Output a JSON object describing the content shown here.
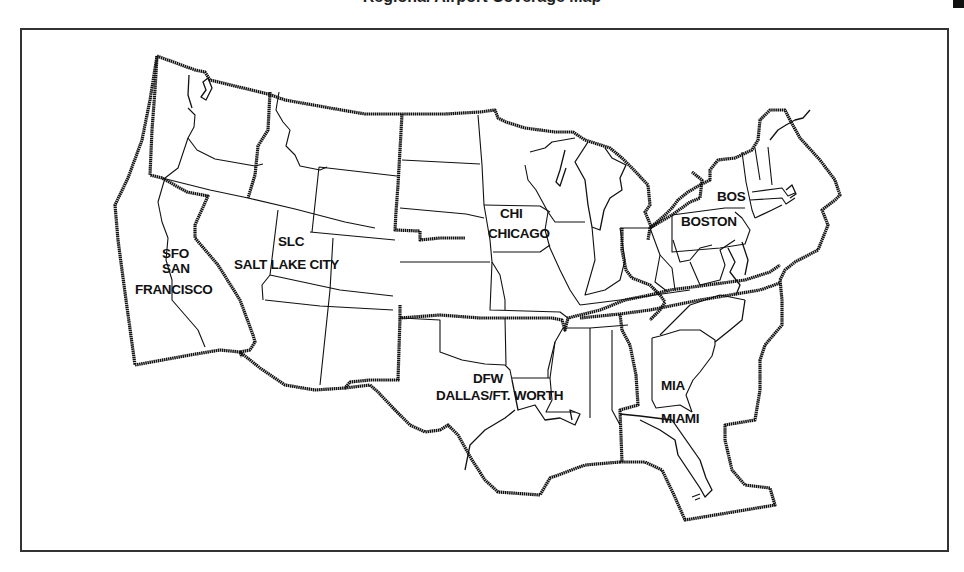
{
  "header": {
    "title": "Regional Airport Coverage Map"
  },
  "map": {
    "type": "region-map",
    "subject": "Contiguous United States divided into service regions",
    "border_color": "#111111",
    "background": "#ffffff",
    "regions": [
      {
        "code": "SFO",
        "name": "SAN",
        "name2": "FRANCISCO"
      },
      {
        "code": "SLC",
        "name": "SALT LAKE CITY"
      },
      {
        "code": "CHI",
        "name": "CHICAGO"
      },
      {
        "code": "BOS",
        "name": "BOSTON"
      },
      {
        "code": "DFW",
        "name": "DALLAS/FT. WORTH"
      },
      {
        "code": "MIA",
        "name": "MIAMI"
      }
    ]
  }
}
